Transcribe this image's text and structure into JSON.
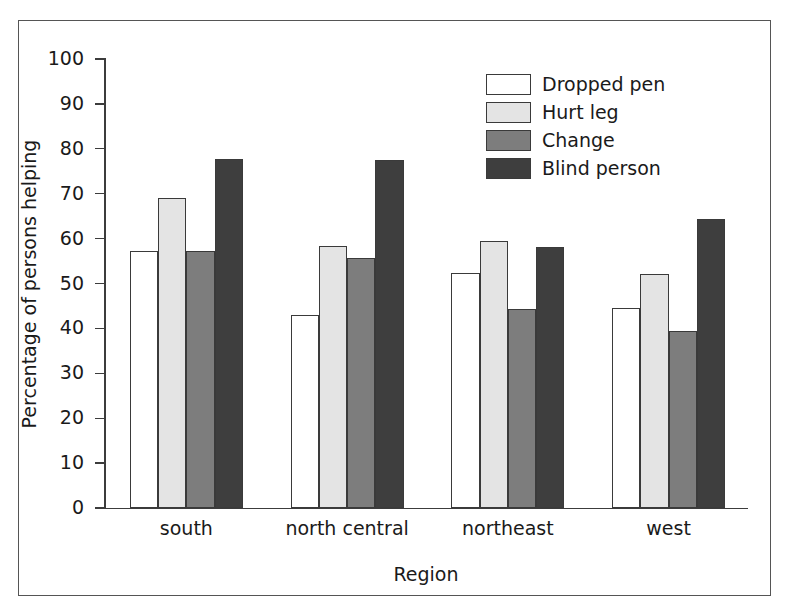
{
  "chart_data": {
    "type": "bar",
    "title": "",
    "xlabel": "Region",
    "ylabel": "Percentage of persons helping",
    "categories": [
      "south",
      "north central",
      "northeast",
      "west"
    ],
    "ylim": [
      0,
      100
    ],
    "yticks": [
      0,
      10,
      20,
      30,
      40,
      50,
      60,
      70,
      80,
      90,
      100
    ],
    "ytick_labels": [
      "0",
      "10",
      "20",
      "30",
      "40",
      "50",
      "60",
      "70",
      "80",
      "90",
      "100"
    ],
    "grid": false,
    "legend_position": "upper right",
    "series": [
      {
        "name": "Dropped pen",
        "color": "#ffffff",
        "values": [
          57.2,
          43.0,
          52.4,
          44.6
        ]
      },
      {
        "name": "Hurt leg",
        "color": "#e4e4e4",
        "values": [
          69.0,
          58.4,
          59.4,
          52.2
        ]
      },
      {
        "name": "Change",
        "color": "#7d7d7d",
        "values": [
          57.2,
          55.7,
          44.4,
          39.4
        ]
      },
      {
        "name": "Blind person",
        "color": "#3e3e3e",
        "values": [
          77.8,
          77.5,
          58.1,
          64.3
        ]
      }
    ]
  },
  "axis": {
    "ylabel": "Percentage of persons helping",
    "xlabel": "Region"
  },
  "legend": {
    "items": [
      {
        "label": "Dropped pen"
      },
      {
        "label": "Hurt leg"
      },
      {
        "label": "Change"
      },
      {
        "label": "Blind person"
      }
    ]
  }
}
